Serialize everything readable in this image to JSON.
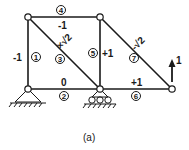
{
  "diagram": {
    "caption": "(a)",
    "load": {
      "label": "1",
      "direction": "up"
    },
    "members": [
      {
        "id": "1",
        "force": "-1"
      },
      {
        "id": "2",
        "force": "0"
      },
      {
        "id": "3",
        "force": "×√2"
      },
      {
        "id": "4",
        "force": "-1"
      },
      {
        "id": "5",
        "force": "+1"
      },
      {
        "id": "6",
        "force": "+1"
      },
      {
        "id": "7",
        "force": "-√2"
      }
    ],
    "colors": {
      "line": "#1a1a1a",
      "background": "#ffffff"
    }
  }
}
